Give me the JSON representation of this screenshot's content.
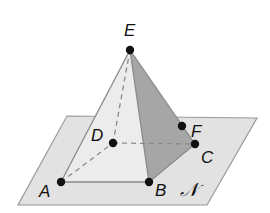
{
  "diagram": {
    "colors": {
      "plane_fill": "#e2e2e2",
      "plane_stroke": "#9a9a9a",
      "front_face_fill": "#ececec",
      "side_face_fill": "#a6a6a6",
      "edge_stroke": "#8a8a8a",
      "point": "#111111"
    },
    "plane": {
      "label": "𝒩",
      "corners": [
        [
          67,
          116
        ],
        [
          257,
          118
        ],
        [
          207,
          205
        ],
        [
          18,
          205
        ]
      ]
    },
    "points": [
      {
        "name": "E",
        "x": 130,
        "y": 50,
        "label_x": 124,
        "label_y": 36
      },
      {
        "name": "A",
        "x": 61,
        "y": 182,
        "label_x": 39,
        "label_y": 197
      },
      {
        "name": "B",
        "x": 149,
        "y": 182,
        "label_x": 155,
        "label_y": 196
      },
      {
        "name": "C",
        "x": 195,
        "y": 144,
        "label_x": 201,
        "label_y": 163
      },
      {
        "name": "D",
        "x": 113,
        "y": 143,
        "label_x": 91,
        "label_y": 141
      },
      {
        "name": "F",
        "x": 182,
        "y": 126,
        "label_x": 191,
        "label_y": 137
      }
    ],
    "edges_solid": [
      [
        "E",
        "A"
      ],
      [
        "E",
        "B"
      ],
      [
        "E",
        "C"
      ],
      [
        "A",
        "B"
      ],
      [
        "B",
        "C"
      ]
    ],
    "edges_dashed": [
      [
        "E",
        "D"
      ],
      [
        "A",
        "D"
      ],
      [
        "D",
        "C"
      ]
    ]
  }
}
